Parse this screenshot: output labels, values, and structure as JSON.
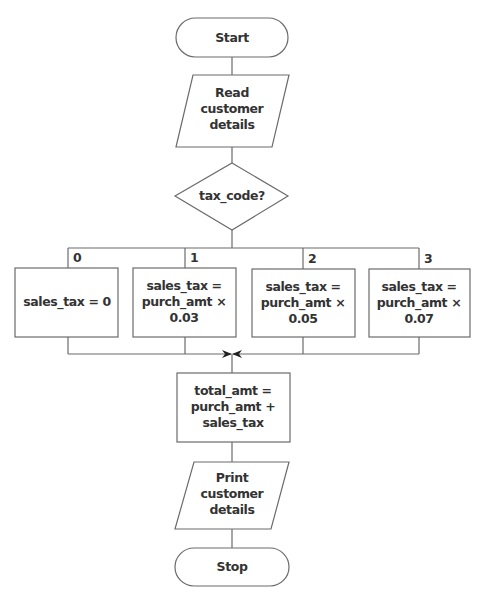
{
  "diagram": {
    "type": "flowchart",
    "start": {
      "label": "Start"
    },
    "read": {
      "lines": [
        "Read",
        "customer",
        "details"
      ]
    },
    "decision": {
      "label": "tax_code?"
    },
    "branches": [
      {
        "code": "0",
        "lines": [
          "sales_tax = 0"
        ]
      },
      {
        "code": "1",
        "lines": [
          "sales_tax =",
          "purch_amt ×",
          "0.03"
        ]
      },
      {
        "code": "2",
        "lines": [
          "sales_tax =",
          "purch_amt ×",
          "0.05"
        ]
      },
      {
        "code": "3",
        "lines": [
          "sales_tax =",
          "purch_amt ×",
          "0.07"
        ]
      }
    ],
    "total": {
      "lines": [
        "total_amt =",
        "purch_amt +",
        "sales_tax"
      ]
    },
    "print": {
      "lines": [
        "Print",
        "customer",
        "details"
      ]
    },
    "stop": {
      "label": "Stop"
    },
    "colors": {
      "stroke": "#6b6b6b",
      "text": "#333333",
      "background": "#ffffff"
    }
  }
}
